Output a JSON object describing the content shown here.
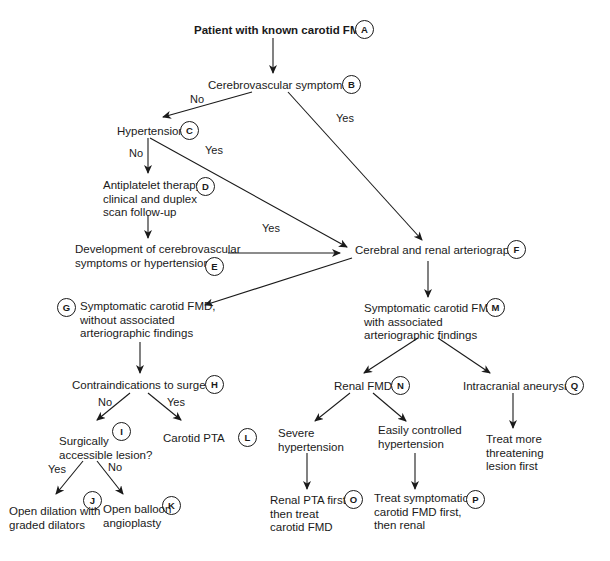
{
  "nodes": {
    "A": {
      "letter": "A",
      "lines": [
        "Patient with known carotid FMD"
      ]
    },
    "B": {
      "letter": "B",
      "lines": [
        "Cerebrovascular symptoms?"
      ]
    },
    "C": {
      "letter": "C",
      "lines": [
        "Hypertension"
      ]
    },
    "D": {
      "letter": "D",
      "lines": [
        "Antiplatelet therapy:",
        "clinical and duplex",
        "scan follow-up"
      ]
    },
    "E": {
      "letter": "E",
      "lines": [
        "Development of cerebrovascular",
        "symptoms or hypertension?"
      ]
    },
    "F": {
      "letter": "F",
      "lines": [
        "Cerebral and renal arteriography"
      ]
    },
    "G": {
      "letter": "G",
      "lines": [
        "Symptomatic carotid FMD,",
        "without associated",
        "arteriographic findings"
      ]
    },
    "H": {
      "letter": "H",
      "lines": [
        "Contraindications to surgery?"
      ]
    },
    "I": {
      "letter": "I",
      "lines": [
        "Surgically",
        "accessible lesion?"
      ]
    },
    "J": {
      "letter": "J",
      "lines": [
        "Open dilation with",
        "graded dilators"
      ]
    },
    "K": {
      "letter": "K",
      "lines": [
        "Open balloon",
        "angioplasty"
      ]
    },
    "L": {
      "letter": "L",
      "lines": [
        "Carotid PTA"
      ]
    },
    "M": {
      "letter": "M",
      "lines": [
        "Symptomatic carotid FMD,",
        "with associated",
        "arteriographic findings"
      ]
    },
    "N": {
      "letter": "N",
      "lines": [
        "Renal FMD"
      ]
    },
    "O": {
      "letter": "O",
      "lines": [
        "Renal PTA first,",
        "then treat",
        "carotid FMD"
      ]
    },
    "P": {
      "letter": "P",
      "lines": [
        "Treat symptomatic",
        "carotid FMD first,",
        "then renal"
      ]
    },
    "Q": {
      "letter": "Q",
      "lines": [
        "Intracranial aneurysm"
      ]
    },
    "N_left": {
      "lines": [
        "Severe",
        "hypertension"
      ]
    },
    "N_right": {
      "lines": [
        "Easily controlled",
        "hypertension"
      ]
    },
    "Q_child": {
      "lines": [
        "Treat more",
        "threatening",
        "lesion first"
      ]
    }
  },
  "edges": {
    "B_no": "No",
    "B_yes": "Yes",
    "C_no": "No",
    "C_yes": "Yes",
    "E_yes": "Yes",
    "H_no": "No",
    "H_yes": "Yes",
    "I_yes": "Yes",
    "I_no": "No"
  }
}
